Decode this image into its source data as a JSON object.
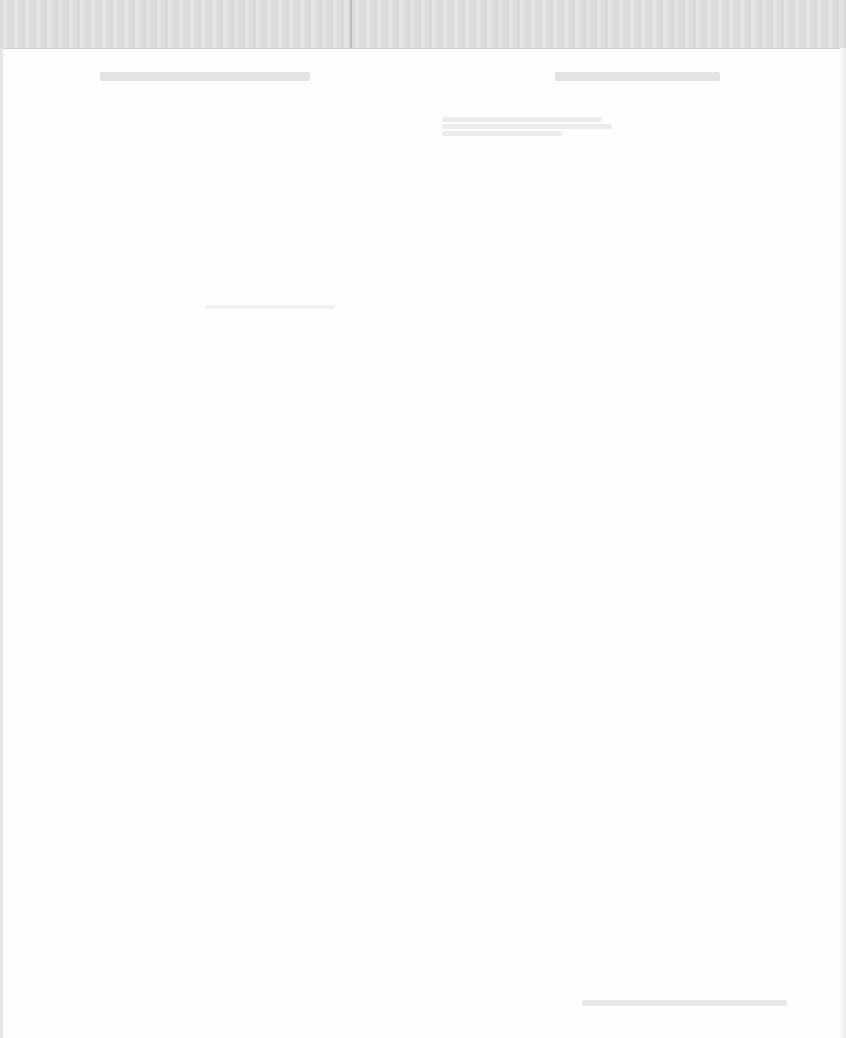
{
  "document": {
    "type": "scanned page (reverse-side bleed-through)",
    "header_left_text": "",
    "header_right_text": "",
    "paragraph_lines": [
      "",
      "",
      ""
    ],
    "mid_text": "",
    "footer_text": ""
  }
}
